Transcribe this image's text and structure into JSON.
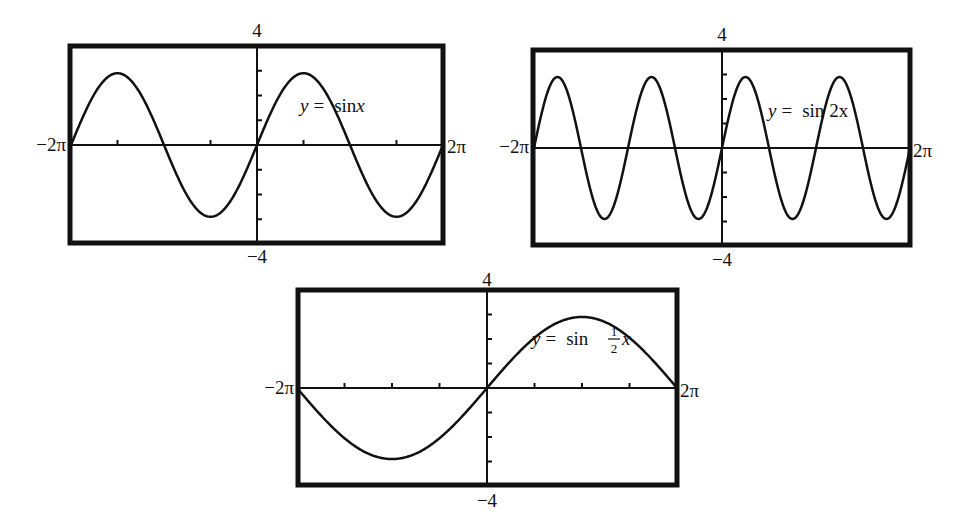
{
  "colors": {
    "ink": "#111111",
    "background": "#ffffff"
  },
  "chart_data": [
    {
      "type": "line",
      "title": "y = sin x",
      "equation": {
        "lhs": "y",
        "eq": "=",
        "fn": "sin",
        "arg": "x"
      },
      "xrange": [
        "-2π",
        "2π"
      ],
      "ylim": [
        -4,
        4
      ],
      "xmin_label": "−2π",
      "xmax_label": "2π",
      "ymax_label": "4",
      "ymin_label": "−4",
      "x_ticks_radians": [
        -4.712,
        -1.571,
        1.571,
        4.712
      ],
      "y_tick_step": 1,
      "amplitude": 1,
      "frequency": 1,
      "series": [
        {
          "name": "sin x",
          "function": "sin(x)"
        }
      ],
      "grid": false
    },
    {
      "type": "line",
      "title": "y = sin 2x",
      "equation": {
        "lhs": "y",
        "eq": "=",
        "fn": "sin",
        "arg": "2x"
      },
      "xrange": [
        "-2π",
        "2π"
      ],
      "ylim": [
        -4,
        4
      ],
      "xmin_label": "−2π",
      "xmax_label": "2π",
      "ymax_label": "4",
      "ymin_label": "−4",
      "y_tick_step": 1,
      "amplitude": 1,
      "frequency": 2,
      "series": [
        {
          "name": "sin 2x",
          "function": "sin(2x)"
        }
      ],
      "grid": false
    },
    {
      "type": "line",
      "title": "y = sin (1/2)x",
      "equation": {
        "lhs": "y",
        "eq": "=",
        "fn": "sin",
        "num": "1",
        "den": "2",
        "arg": "x"
      },
      "xrange": [
        "-2π",
        "2π"
      ],
      "ylim": [
        -4,
        4
      ],
      "xmin_label": "−2π",
      "xmax_label": "2π",
      "ymax_label": "4",
      "ymin_label": "−4",
      "x_ticks_radians": [
        -4.712,
        -3.142,
        -1.571,
        1.571,
        3.142,
        4.712
      ],
      "y_tick_step": 1,
      "amplitude": 1,
      "frequency": 0.5,
      "series": [
        {
          "name": "sin x/2",
          "function": "sin(x/2)"
        }
      ],
      "grid": false
    }
  ]
}
